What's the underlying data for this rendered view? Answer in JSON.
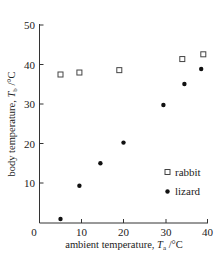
{
  "chart_data": {
    "type": "scatter",
    "title": "",
    "xlabel": "ambient temperature, T_a / °C",
    "ylabel": "body temperature, T_b / °C",
    "xlim": [
      0,
      40
    ],
    "ylim": [
      0,
      50
    ],
    "xticks": [
      0,
      10,
      20,
      30,
      40
    ],
    "yticks": [
      10,
      20,
      30,
      40,
      50
    ],
    "grid": false,
    "legend_position": "lower right",
    "series": [
      {
        "name": "rabbit",
        "marker": "open-square",
        "points": [
          [
            5,
            37.5
          ],
          [
            9.5,
            38
          ],
          [
            19,
            38.6
          ],
          [
            34,
            41.4
          ],
          [
            39,
            42.6
          ]
        ]
      },
      {
        "name": "lizard",
        "marker": "filled-circle",
        "points": [
          [
            5,
            1
          ],
          [
            9.5,
            9.4
          ],
          [
            14.5,
            15.1
          ],
          [
            20,
            20.3
          ],
          [
            29.5,
            29.8
          ],
          [
            34.5,
            35.1
          ],
          [
            38.5,
            38.9
          ]
        ]
      }
    ]
  },
  "labels": {
    "x_origin": "0",
    "x_ticks": [
      "10",
      "20",
      "30",
      "40"
    ],
    "y_ticks": [
      "10",
      "20",
      "30",
      "40",
      "50"
    ],
    "x_title_prefix": "ambient temperature, ",
    "x_title_var": "T",
    "x_title_sub": "a",
    "x_title_unit": " /°C",
    "y_title_prefix": "body temperature, ",
    "y_title_var": "T",
    "y_title_sub": "b",
    "y_title_unit": " /°C",
    "legend_rabbit": "rabbit",
    "legend_lizard": "lizard"
  }
}
